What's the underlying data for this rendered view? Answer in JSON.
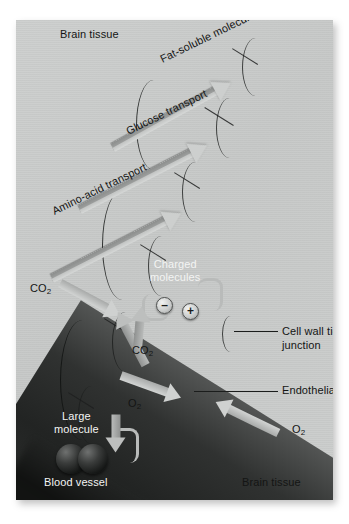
{
  "figure": {
    "background_color": "#c9cbcb",
    "plate": {
      "x": 16,
      "y": 20,
      "width": 317,
      "height": 480
    }
  },
  "region_labels": [
    {
      "id": "brain-tissue-top",
      "text": "Brain tissue",
      "color": "#141514"
    },
    {
      "id": "brain-tissue-bottom",
      "text": "Brain tissue",
      "color": "#141514"
    },
    {
      "id": "blood-vessel",
      "text": "Blood vessel",
      "color": "#f3f4f3"
    }
  ],
  "transport_arrows": [
    {
      "id": "fat-soluble",
      "label": "Fat-soluble molecule",
      "direction": "vessel-to-brain"
    },
    {
      "id": "glucose",
      "label": "Glucose transport",
      "direction": "vessel-to-brain"
    },
    {
      "id": "amino-acid",
      "label": "Amino-acid transport",
      "direction": "vessel-to-brain"
    }
  ],
  "gas_arrows": [
    {
      "id": "co2-upper",
      "label": "CO",
      "subscript": "2",
      "direction": "vessel-to-brain"
    },
    {
      "id": "co2-lower",
      "label": "CO",
      "subscript": "2",
      "direction": "brain-to-vessel"
    },
    {
      "id": "o2-inner",
      "label": "O",
      "subscript": "2",
      "direction": "brain-to-vessel"
    },
    {
      "id": "o2-outer",
      "label": "O",
      "subscript": "2",
      "direction": "brain-to-vessel"
    }
  ],
  "charged": {
    "label_line1": "Charged",
    "label_line2": "molecules",
    "negative_symbol": "–",
    "positive_symbol": "+"
  },
  "large_molecule": {
    "label_line1": "Large",
    "label_line2": "molecule",
    "sphere_count": 2,
    "sphere_color": "#121413"
  },
  "callouts": [
    {
      "id": "cell-wall-tight-junction",
      "line1": "Cell wall tight",
      "line2": "junction"
    },
    {
      "id": "endothelial-cell",
      "line1": "Endothelial cell",
      "line2": ""
    }
  ],
  "colors": {
    "brain_tissue": "#c9cbcb",
    "vessel_lumen": "#222423",
    "endothelial_wall": "#9a9c9b",
    "wall_highlight": "#e0e2e1",
    "arrow_body": "#c3c5c4",
    "text_dark": "#141514",
    "text_light": "#f3f4f3"
  }
}
